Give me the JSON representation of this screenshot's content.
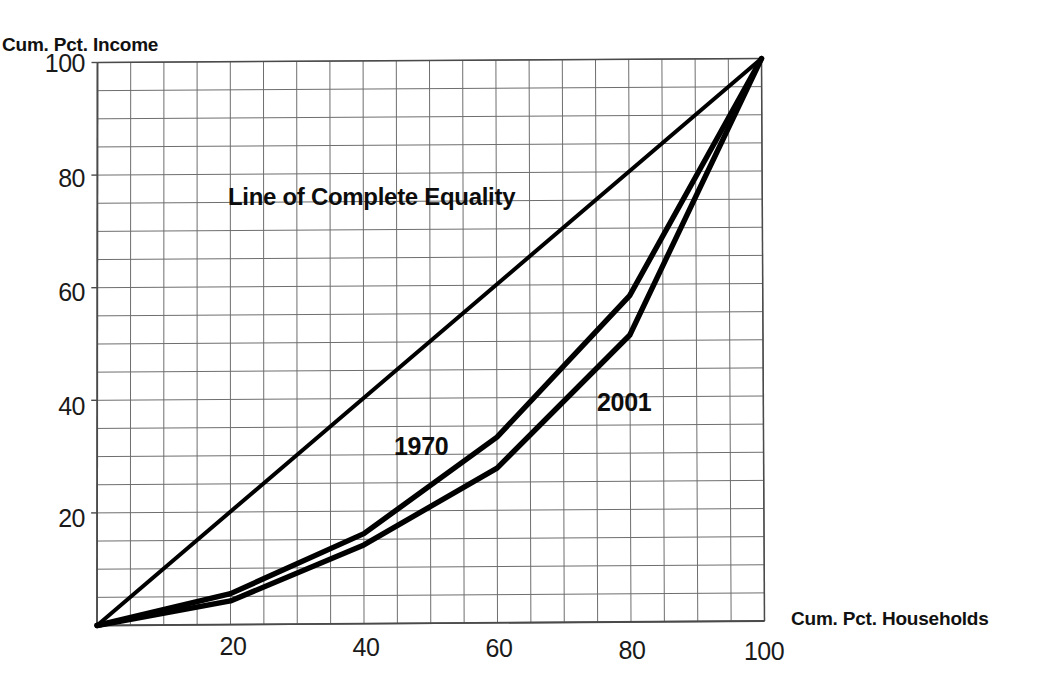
{
  "chart_data": {
    "type": "line",
    "title": "",
    "subtitle": "",
    "xlabel": "Cum. Pct. Households",
    "ylabel": "Cum. Pct. Income",
    "xlim": [
      0,
      100
    ],
    "ylim": [
      0,
      100
    ],
    "xticks": [
      20,
      40,
      60,
      80,
      100
    ],
    "yticks": [
      20,
      40,
      60,
      80,
      100
    ],
    "xtick_labels": [
      "20",
      "40",
      "60",
      "80",
      "100"
    ],
    "ytick_labels": [
      "20",
      "40",
      "60",
      "80",
      "100"
    ],
    "grid": true,
    "grid_step": 5,
    "legend": "none",
    "annotations": [
      {
        "text": "Line of Complete Equality",
        "x": 20,
        "y": 78
      },
      {
        "text": "1970",
        "x": 46,
        "y": 36
      },
      {
        "text": "2001",
        "x": 76,
        "y": 44
      }
    ],
    "series": [
      {
        "name": "Line of Complete Equality",
        "x": [
          0,
          100
        ],
        "values": [
          0,
          100
        ]
      },
      {
        "name": "1970",
        "x": [
          0,
          20,
          40,
          60,
          80,
          100
        ],
        "values": [
          0,
          5.5,
          16,
          33,
          58,
          100
        ]
      },
      {
        "name": "2001",
        "x": [
          0,
          20,
          40,
          60,
          80,
          100
        ],
        "values": [
          0,
          4.2,
          14,
          27.5,
          51,
          100
        ]
      }
    ]
  },
  "axis_titles": {
    "y": "Cum. Pct. Income",
    "x": "Cum. Pct. Households"
  },
  "ticks": {
    "y": [
      "100",
      "80",
      "60",
      "40",
      "20"
    ],
    "x": [
      "20",
      "40",
      "60",
      "80",
      "100"
    ]
  },
  "annotations": {
    "equality": "Line of Complete Equality",
    "curve_1970": "1970",
    "curve_2001": "2001"
  },
  "colors": {
    "ink": "#000000",
    "grid": "#6e6e6e",
    "axis": "#4a4a4a",
    "background": "#ffffff"
  }
}
